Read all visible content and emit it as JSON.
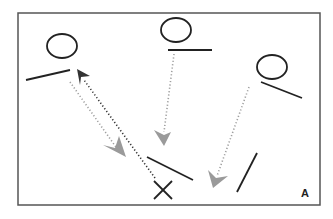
{
  "figure": {
    "panel_label": "A",
    "frame": {
      "x": 18,
      "y": 13,
      "width": 302,
      "height": 192,
      "stroke": "#555555"
    },
    "colors": {
      "ink": "#222222",
      "gray_arrow": "#9a9a9a",
      "black_arrow": "#333333"
    },
    "objects": [
      {
        "id": "observer-1",
        "circle": {
          "cx": 62,
          "cy": 46,
          "rx": 15,
          "ry": 12
        },
        "line": [
          26,
          80,
          70,
          70
        ]
      },
      {
        "id": "observer-2",
        "circle": {
          "cx": 176,
          "cy": 30,
          "rx": 15,
          "ry": 12
        },
        "line": [
          168,
          50,
          212,
          50
        ]
      },
      {
        "id": "observer-3",
        "circle": {
          "cx": 272,
          "cy": 67,
          "rx": 15,
          "ry": 12
        },
        "line": [
          261,
          82,
          302,
          98
        ]
      }
    ],
    "targets": [
      {
        "id": "center-line",
        "line": [
          147,
          157,
          193,
          180
        ]
      },
      {
        "id": "right-line",
        "line": [
          237,
          192,
          257,
          153
        ]
      }
    ],
    "x_mark": {
      "cx": 163,
      "cy": 190,
      "size": 9
    },
    "arrows": [
      {
        "id": "gray-arrow-1",
        "style": "gray",
        "from": [
          70,
          82
        ],
        "to": [
          117,
          146
        ],
        "head": [
          118,
          153
        ]
      },
      {
        "id": "black-arrow",
        "style": "black",
        "from": [
          154,
          178
        ],
        "to": [
          84,
          80
        ],
        "head": [
          78,
          71
        ]
      },
      {
        "id": "gray-arrow-2",
        "style": "gray",
        "from": [
          174,
          54
        ],
        "to": [
          164,
          130
        ],
        "head": [
          163,
          139
        ]
      },
      {
        "id": "gray-arrow-3",
        "style": "gray",
        "from": [
          249,
          87
        ],
        "to": [
          218,
          175
        ],
        "head": [
          214,
          185
        ]
      }
    ]
  }
}
